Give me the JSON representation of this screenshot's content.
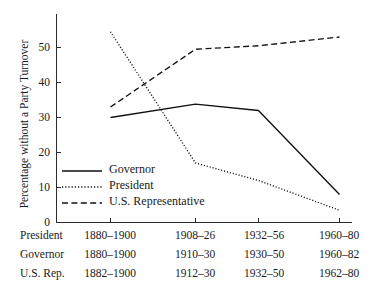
{
  "chart_data": {
    "type": "line",
    "title": "",
    "xlabel": "",
    "ylabel": "Percentage without a Party Turnover",
    "ylim": [
      0,
      57
    ],
    "yticks": [
      0,
      10,
      20,
      30,
      40,
      50
    ],
    "ytick_labels": [
      "0",
      "10",
      "20",
      "30",
      "40",
      "50"
    ],
    "grid": false,
    "legend_position": "center-left",
    "x": [
      1,
      2,
      3,
      4
    ],
    "categories": [
      "period-1",
      "period-2",
      "period-3",
      "period-4"
    ],
    "series": [
      {
        "name": "Governor",
        "style": "solid",
        "values": [
          30,
          33.8,
          32,
          8
        ]
      },
      {
        "name": "President",
        "style": "dotted",
        "values": [
          54.5,
          17,
          12,
          3.5
        ]
      },
      {
        "name": "U.S. Representative",
        "style": "dashed",
        "values": [
          33,
          49.5,
          50.5,
          53
        ]
      }
    ],
    "x_axis_table": {
      "row_labels": [
        "President",
        "Governor",
        "U.S. Rep."
      ],
      "rows": [
        [
          "1880–1900",
          "1908–26",
          "1932–56",
          "1960–80"
        ],
        [
          "1880–1900",
          "1910–30",
          "1930–50",
          "1960–82"
        ],
        [
          "1882–1900",
          "1912–30",
          "1932–50",
          "1962–80"
        ]
      ]
    }
  },
  "legend": {
    "items": [
      {
        "label": "Governor",
        "style": "solid"
      },
      {
        "label": "President",
        "style": "dotted"
      },
      {
        "label": "U.S. Representative",
        "style": "dashed"
      }
    ]
  },
  "colors": {
    "line": "#111111",
    "axis": "#2b2b2b",
    "text": "#1a1a1a",
    "background": "#ffffff"
  }
}
